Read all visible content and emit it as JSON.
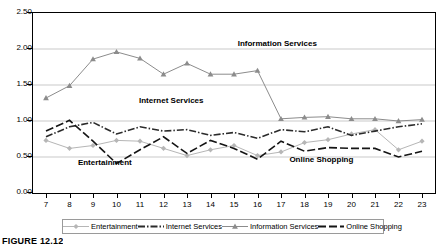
{
  "caption": "FIGURE 12.12",
  "chart_data": {
    "type": "line",
    "title": "",
    "subtitle": "",
    "xlabel": "",
    "ylabel": "",
    "x": [
      7,
      8,
      9,
      10,
      11,
      12,
      13,
      14,
      15,
      16,
      17,
      18,
      19,
      20,
      21,
      22,
      23
    ],
    "xtick_labels": [
      "7",
      "8",
      "9",
      "10",
      "11",
      "12",
      "13",
      "14",
      "15",
      "16",
      "17",
      "18",
      "19",
      "20",
      "21",
      "22",
      "23"
    ],
    "ytick_labels": [
      "0.00",
      "0.50",
      "1.00",
      "1.50",
      "2.00",
      "2.50"
    ],
    "ytick_values": [
      0.0,
      0.5,
      1.0,
      1.5,
      2.0,
      2.5
    ],
    "ylim": [
      0.0,
      2.5
    ],
    "xlim": [
      7,
      23
    ],
    "grid": "horizontal",
    "legend_position": "bottom",
    "series": [
      {
        "name": "Entertainment",
        "color": "#b6b6b6",
        "marker": "diamond",
        "dash": "solid",
        "values": [
          0.73,
          0.62,
          0.66,
          0.73,
          0.72,
          0.62,
          0.52,
          0.6,
          0.66,
          0.52,
          0.57,
          0.7,
          0.74,
          0.82,
          0.88,
          0.6,
          0.72
        ]
      },
      {
        "name": "Internet Services",
        "color": "#2b2b2b",
        "marker": "square",
        "dash": "dash-dot",
        "values": [
          0.78,
          0.92,
          0.98,
          0.82,
          0.92,
          0.86,
          0.88,
          0.8,
          0.84,
          0.76,
          0.88,
          0.85,
          0.92,
          0.8,
          0.86,
          0.92,
          0.96
        ]
      },
      {
        "name": "Information Services",
        "color": "#8c8c8c",
        "marker": "triangle",
        "dash": "solid",
        "values": [
          1.32,
          1.49,
          1.86,
          1.96,
          1.87,
          1.65,
          1.8,
          1.65,
          1.65,
          1.7,
          1.03,
          1.05,
          1.06,
          1.03,
          1.03,
          1.0,
          1.02
        ]
      },
      {
        "name": "Online Shopping",
        "color": "#151515",
        "marker": "square",
        "dash": "long-dash",
        "values": [
          0.86,
          1.01,
          0.72,
          0.41,
          0.6,
          0.78,
          0.55,
          0.73,
          0.62,
          0.47,
          0.72,
          0.58,
          0.63,
          0.62,
          0.62,
          0.5,
          0.58
        ]
      }
    ],
    "annotations": [
      {
        "text": "Information Services",
        "x": 15.2,
        "y": 2.06
      },
      {
        "text": "Internet Services",
        "x": 11.0,
        "y": 1.27
      },
      {
        "text": "Entertainment",
        "x": 8.4,
        "y": 0.4
      },
      {
        "text": "Online Shopping",
        "x": 17.4,
        "y": 0.44
      }
    ]
  },
  "legend": {
    "items": [
      {
        "label": "Entertainment",
        "color": "#b6b6b6",
        "marker": "diamond",
        "dash": "solid"
      },
      {
        "label": "Internet Services",
        "color": "#2b2b2b",
        "marker": "square",
        "dash": "dash-dot"
      },
      {
        "label": "Information Services",
        "color": "#8c8c8c",
        "marker": "triangle",
        "dash": "solid"
      },
      {
        "label": "Online Shopping",
        "color": "#151515",
        "marker": "square",
        "dash": "long-dash"
      }
    ]
  }
}
